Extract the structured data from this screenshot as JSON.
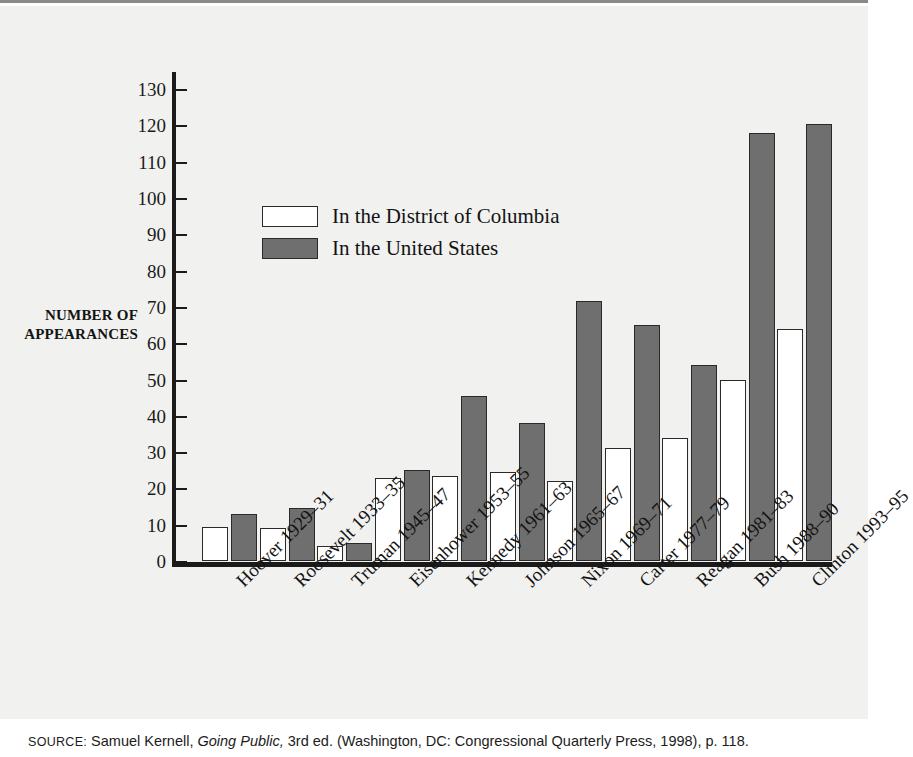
{
  "chart_data": {
    "type": "bar",
    "title": "",
    "xlabel": "",
    "ylabel": "NUMBER OF APPEARANCES",
    "ylim": [
      0,
      135
    ],
    "ytick_step": 10,
    "yticks": [
      0,
      10,
      20,
      30,
      40,
      50,
      60,
      70,
      80,
      90,
      100,
      110,
      120,
      130
    ],
    "grid": false,
    "legend_position": "upper-left-inside",
    "categories": [
      "Hoover 1929–31",
      "Roosevelt 1933–35",
      "Truman 1945–47",
      "Eisenhower 1953–55",
      "Kennedy 1961–63",
      "Johnson 1965–67",
      "Nixon 1969–71",
      "Carter 1977–79",
      "Reagan 1981–83",
      "Bush 1988–90",
      "Clinton 1993–95"
    ],
    "series": [
      {
        "name": "In the District of Columbia",
        "color": "#ffffff",
        "values": [
          9.5,
          9,
          4,
          23,
          23.5,
          24.5,
          22,
          31,
          34,
          50,
          64
        ]
      },
      {
        "name": "In the United States",
        "color": "#6f6f6f",
        "values": [
          13,
          14.5,
          5,
          25,
          45.5,
          38,
          71.5,
          65,
          54,
          118,
          120.5
        ]
      }
    ]
  },
  "axis": {
    "y_title_line1": "NUMBER OF",
    "y_title_line2": "APPEARANCES"
  },
  "legend": {
    "items": [
      {
        "label": "In the District of Columbia",
        "swatch": "white"
      },
      {
        "label": "In the United States",
        "swatch": "gray"
      }
    ]
  },
  "source": {
    "prefix": "SOURCE:",
    "author": " Samuel Kernell, ",
    "work": "Going Public,",
    "rest": " 3rd ed. (Washington, DC: Congressional Quarterly Press, 1998), p. 118."
  },
  "colors": {
    "plate_background": "#f1f1f0",
    "axis": "#1b1b1b",
    "bar_dc": "#ffffff",
    "bar_us": "#6f6f6f",
    "bar_outline": "#2a2a2a",
    "bar_shadow": "#c9c9c7",
    "text": "#131313"
  }
}
